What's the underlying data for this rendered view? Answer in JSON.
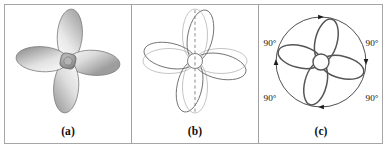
{
  "figure": {
    "background_color": "#ffffff",
    "frame_color": "#a6a6a6",
    "divider_color": "#a0a0a0"
  },
  "panels": [
    {
      "id": "a",
      "caption": "(a)",
      "description": "Shaded four-bladed propeller",
      "blade_count": 4,
      "blade_fill_light": "#f2f2f2",
      "blade_fill_dark": "#9a9a9a",
      "outline_color": "#7d7d7d",
      "hub_fill": "#8f8f8f",
      "rotation_deg": 12
    },
    {
      "id": "b",
      "caption": "(b)",
      "description": "Propeller outline with vertical dashed mirror axis and overlaid rotated copy",
      "blade_count": 4,
      "outline_color": "#6f6f6f",
      "ghost_outline_color": "#b5b5b5",
      "axis_style": "dashed",
      "axis_color": "#8a8a8a",
      "axis_orientation": "vertical",
      "rotation_deg": 12
    },
    {
      "id": "c",
      "caption": "(c)",
      "description": "Propeller outline inscribed in a circle with clockwise rotation arrows marking four 90-degree arcs",
      "blade_count": 4,
      "outline_color": "#555555",
      "circle_color": "#3c3c3c",
      "arrow_color": "#1a1a1a",
      "rotation_direction": "clockwise",
      "arrow_count": 4,
      "angle_labels": [
        {
          "position": "top-left",
          "text": "90°"
        },
        {
          "position": "top-right",
          "text": "90°"
        },
        {
          "position": "bottom-left",
          "text": "90°"
        },
        {
          "position": "bottom-right",
          "text": "90°"
        }
      ],
      "rotation_deg": 14
    }
  ]
}
